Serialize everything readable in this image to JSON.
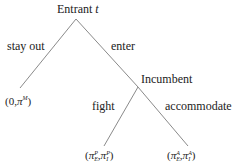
{
  "diagram": {
    "type": "game-tree",
    "nodes": {
      "root": {
        "label": "Entrant",
        "label_var": "t"
      },
      "incumbent": {
        "label": "Incumbent"
      }
    },
    "edges": {
      "stay_out": {
        "label": "stay out"
      },
      "enter": {
        "label": "enter"
      },
      "fight": {
        "label": "fight"
      },
      "accommodate": {
        "label": "accommodate"
      }
    },
    "payoffs": {
      "stay_out": {
        "open": "(",
        "first": "0",
        "sep": ",",
        "second_base": "π",
        "second_sup": "M",
        "close": ")"
      },
      "fight": {
        "open": "(",
        "a_base": "π",
        "a_sup": "P",
        "a_sub": "E",
        "sep": ",",
        "b_base": "π",
        "b_sup": "P",
        "b_sub": "I",
        "close": ")"
      },
      "accommodate": {
        "open": "(",
        "a_base": "π",
        "a_sup": "A",
        "a_sub": "E",
        "sep": ",",
        "b_base": "π",
        "b_sup": "A",
        "b_sub": "I",
        "close": ")"
      }
    },
    "colors": {
      "line": "#8a8a8a",
      "text": "#222222"
    }
  }
}
